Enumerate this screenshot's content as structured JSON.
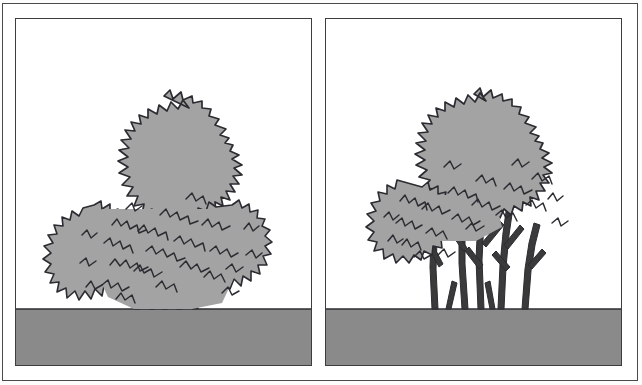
{
  "figure": {
    "width": 642,
    "height": 385,
    "style": "line-art-diagram",
    "background_color": "#ffffff",
    "outer_frame_color": "#4a4a4a",
    "panel_border_color": "#3d3d3d"
  },
  "palette": {
    "foliage_fill": "#a3a3a3",
    "foliage_outline": "#2b2b32",
    "ground_fill": "#8a8a8a",
    "ground_outline": "#2b2b32",
    "trunk_fill": "#3a3a3a",
    "sky_fill": "#ffffff"
  },
  "panels": [
    {
      "id": "panel-left",
      "position": "left",
      "caption": "",
      "subject": "multi-stem tree with full low foliage reaching near ground",
      "ground": {
        "label": "ground",
        "top_y_fraction": 0.84
      },
      "tree": {
        "label": "unpruned tree",
        "crown_shape": "broad ragged ovoid",
        "crown_top_y_fraction": 0.23,
        "crown_bottom_y_fraction": 0.86,
        "crown_left_x_fraction": 0.17,
        "crown_right_x_fraction": 0.83,
        "visible_trunk_height_fraction": 0.05,
        "stem_count": 5,
        "lower_branches_visible": false
      }
    },
    {
      "id": "panel-right",
      "position": "right",
      "caption": "",
      "subject": "same multi-stem tree limbed-up, lower branches exposed",
      "ground": {
        "label": "ground",
        "top_y_fraction": 0.84
      },
      "tree": {
        "label": "pruned tree",
        "crown_shape": "rounded ragged canopy raised above branches",
        "crown_top_y_fraction": 0.23,
        "crown_bottom_y_fraction": 0.62,
        "crown_left_x_fraction": 0.17,
        "crown_right_x_fraction": 0.83,
        "visible_trunk_height_fraction": 0.3,
        "stem_count": 5,
        "lower_branches_visible": true
      }
    }
  ]
}
